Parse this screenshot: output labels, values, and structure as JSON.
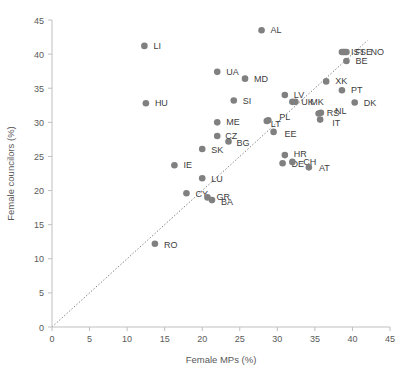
{
  "chart_data": {
    "type": "scatter",
    "title": "",
    "xlabel": "Female MPs (%)",
    "ylabel": "Female councilors (%)",
    "xlim": [
      0,
      45
    ],
    "ylim": [
      0,
      45
    ],
    "xticks": [
      0,
      5,
      10,
      15,
      20,
      25,
      30,
      35,
      40,
      45
    ],
    "yticks": [
      0,
      5,
      10,
      15,
      20,
      25,
      30,
      35,
      40,
      45
    ],
    "grid": false,
    "legend": "none",
    "marker_color": "#808080",
    "reference_line": {
      "type": "identity",
      "style": "dotted",
      "color": "#808080",
      "from": [
        0,
        0
      ],
      "to": [
        42,
        42
      ]
    },
    "points": [
      {
        "label": "AL",
        "x": 27.9,
        "y": 43.5,
        "lx": 9,
        "ly": 3
      },
      {
        "label": "LI",
        "x": 12.3,
        "y": 41.2,
        "lx": 9,
        "ly": 3
      },
      {
        "label": "IS",
        "x": 38.6,
        "y": 40.3,
        "lx": 9,
        "ly": 3
      },
      {
        "label": "FI",
        "x": 38.8,
        "y": 40.3,
        "lx": 12,
        "ly": 3
      },
      {
        "label": "SE",
        "x": 39.0,
        "y": 40.3,
        "lx": 15,
        "ly": 3
      },
      {
        "label": "NO",
        "x": 39.2,
        "y": 40.3,
        "lx": 24,
        "ly": 3
      },
      {
        "label": "BE",
        "x": 39.2,
        "y": 39.0,
        "lx": 9,
        "ly": 3
      },
      {
        "label": "UA",
        "x": 22.0,
        "y": 37.4,
        "lx": 9,
        "ly": 3
      },
      {
        "label": "MD",
        "x": 25.7,
        "y": 36.4,
        "lx": 9,
        "ly": 3
      },
      {
        "label": "XK",
        "x": 36.5,
        "y": 36.0,
        "lx": 9,
        "ly": 3
      },
      {
        "label": "PT",
        "x": 38.6,
        "y": 34.7,
        "lx": 9,
        "ly": 3
      },
      {
        "label": "LV",
        "x": 31.0,
        "y": 34.0,
        "lx": 9,
        "ly": 3
      },
      {
        "label": "SI",
        "x": 24.2,
        "y": 33.2,
        "lx": 9,
        "ly": 3
      },
      {
        "label": "HU",
        "x": 12.5,
        "y": 32.8,
        "lx": 9,
        "ly": 3
      },
      {
        "label": "UK",
        "x": 32.0,
        "y": 33.0,
        "lx": 9,
        "ly": 3
      },
      {
        "label": "MK",
        "x": 32.4,
        "y": 33.0,
        "lx": 15,
        "ly": 3
      },
      {
        "label": "DK",
        "x": 40.3,
        "y": 32.9,
        "lx": 9,
        "ly": 3
      },
      {
        "label": "RS",
        "x": 35.5,
        "y": 31.3,
        "lx": 8,
        "ly": 3
      },
      {
        "label": "NL",
        "x": 35.8,
        "y": 31.4,
        "lx": 14,
        "ly": 1
      },
      {
        "label": "IT",
        "x": 35.7,
        "y": 30.4,
        "lx": 12,
        "ly": 6
      },
      {
        "label": "LT",
        "x": 28.6,
        "y": 30.2,
        "lx": 4,
        "ly": 6
      },
      {
        "label": "PL",
        "x": 28.8,
        "y": 30.3,
        "lx": 11,
        "ly": 0
      },
      {
        "label": "ME",
        "x": 22.0,
        "y": 30.0,
        "lx": 9,
        "ly": 3
      },
      {
        "label": "BG",
        "x": 23.5,
        "y": 27.2,
        "lx": 8,
        "ly": 5
      },
      {
        "label": "CZ",
        "x": 22.0,
        "y": 28.0,
        "lx": 8,
        "ly": 3
      },
      {
        "label": "EE",
        "x": 29.5,
        "y": 28.6,
        "lx": 11,
        "ly": 5
      },
      {
        "label": "SK",
        "x": 20.0,
        "y": 26.1,
        "lx": 9,
        "ly": 4
      },
      {
        "label": "HR",
        "x": 31.0,
        "y": 25.2,
        "lx": 9,
        "ly": 2
      },
      {
        "label": "DE",
        "x": 30.7,
        "y": 24.0,
        "lx": 9,
        "ly": 4
      },
      {
        "label": "CH",
        "x": 32.0,
        "y": 24.2,
        "lx": 11,
        "ly": 3
      },
      {
        "label": "AT",
        "x": 34.2,
        "y": 23.4,
        "lx": 10,
        "ly": 4
      },
      {
        "label": "IE",
        "x": 16.3,
        "y": 23.7,
        "lx": 9,
        "ly": 3
      },
      {
        "label": "LU",
        "x": 20.0,
        "y": 21.8,
        "lx": 9,
        "ly": 4
      },
      {
        "label": "CY",
        "x": 17.9,
        "y": 19.6,
        "lx": 9,
        "ly": 4
      },
      {
        "label": "GR",
        "x": 20.7,
        "y": 19.0,
        "lx": 9,
        "ly": 3
      },
      {
        "label": "BA",
        "x": 21.3,
        "y": 18.6,
        "lx": 9,
        "ly": 5
      },
      {
        "label": "RO",
        "x": 13.7,
        "y": 12.2,
        "lx": 9,
        "ly": 4
      }
    ]
  }
}
